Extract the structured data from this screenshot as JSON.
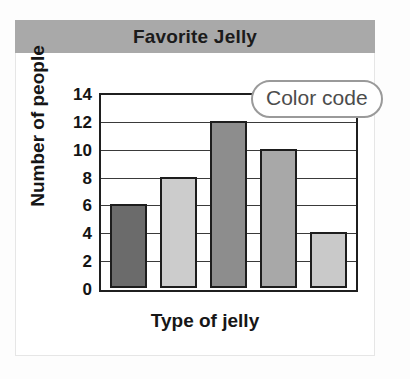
{
  "figure": {
    "title": "Favorite Jelly",
    "callout_label": "Color code"
  },
  "chart_data": {
    "type": "bar",
    "title": "Favorite Jelly",
    "xlabel": "Type of jelly",
    "ylabel": "Number of people",
    "categories": [
      "",
      "",
      "",
      "",
      ""
    ],
    "values": [
      6,
      8,
      12,
      10,
      4
    ],
    "bar_colors": [
      "#6b6b6b",
      "#cccccc",
      "#8d8d8d",
      "#a8a8a8",
      "#c9c9c9"
    ],
    "ylim": [
      0,
      14
    ],
    "ytick_labels": [
      "0",
      "2",
      "4",
      "6",
      "8",
      "10",
      "12",
      "14"
    ],
    "ytick_values": [
      0,
      2,
      4,
      6,
      8,
      10,
      12,
      14
    ],
    "grid": true,
    "legend": "none",
    "annotations": [
      "Color code"
    ]
  },
  "colors": {
    "title_band": "#a9a9a9",
    "axis": "#1f1f1f",
    "callout_border": "#9a9a9a",
    "callout_text": "#4c4c4c"
  }
}
